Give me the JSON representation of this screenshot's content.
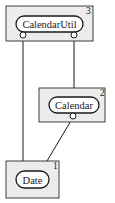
{
  "diagram": {
    "type": "dependency-layers",
    "nodes": [
      {
        "id": "calendarutil",
        "label": "CalendarUtil",
        "layer": "3"
      },
      {
        "id": "calendar",
        "label": "Calendar",
        "layer": "2"
      },
      {
        "id": "date",
        "label": "Date",
        "layer": "1"
      }
    ],
    "edges": [
      {
        "from": "CalendarUtil",
        "to": "Date"
      },
      {
        "from": "CalendarUtil",
        "to": "Calendar"
      },
      {
        "from": "Calendar",
        "to": "Date"
      }
    ],
    "colors": {
      "box_fill": "#ececec",
      "stroke": "#1a1a1a",
      "pill_fill": "#ffffff"
    }
  }
}
